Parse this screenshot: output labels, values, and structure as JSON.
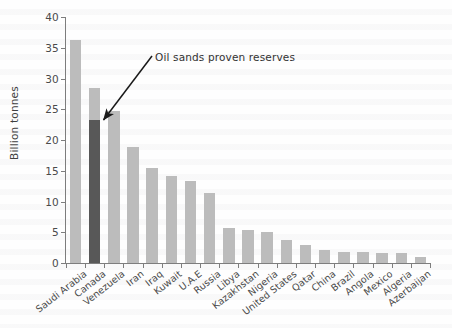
{
  "chart_data": {
    "type": "bar",
    "title": "",
    "xlabel": "",
    "ylabel": "Billion tonnes",
    "ylim": [
      0,
      40
    ],
    "yticks": [
      0,
      5,
      10,
      15,
      20,
      25,
      30,
      35,
      40
    ],
    "grid": false,
    "legend_position": "none",
    "categories": [
      "Saudi Arabia",
      "Canada",
      "Venezuela",
      "Iran",
      "Iraq",
      "Kuwait",
      "U.A.E",
      "Russia",
      "Libya",
      "Kazakhstan",
      "Nigeria",
      "United States",
      "Qatar",
      "China",
      "Brazil",
      "Angola",
      "Mexico",
      "Algeria",
      "Azerbaijan"
    ],
    "values": [
      36.3,
      28.5,
      24.7,
      18.9,
      15.5,
      14.2,
      13.3,
      11.4,
      5.7,
      5.3,
      5.0,
      3.7,
      2.9,
      2.1,
      1.8,
      1.8,
      1.6,
      1.6,
      1.0
    ],
    "highlight": {
      "category": "Canada",
      "value": 23.2,
      "label": "Oil sands proven reserves"
    },
    "annotations": [
      {
        "text": "Oil sands proven reserves",
        "target_category": "Canada",
        "target_value": 23.2
      }
    ],
    "colors": {
      "bar": "#bcbcbc",
      "highlight_bar": "#585858",
      "axis": "#7d7d7d",
      "text": "#4a4a4a",
      "background": "#fefefe"
    }
  }
}
